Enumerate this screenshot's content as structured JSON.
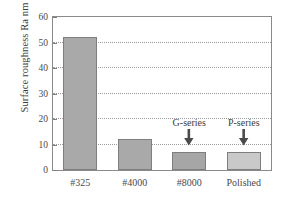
{
  "chart_data": {
    "type": "bar",
    "title": "",
    "xlabel": "",
    "ylabel": "Surface roughness Ra nm",
    "categories": [
      "#325",
      "#4000",
      "#8000",
      "Polished"
    ],
    "values": [
      52,
      12,
      7,
      7
    ],
    "ylim": [
      0,
      60
    ],
    "yticks": [
      0,
      10,
      20,
      30,
      40,
      50,
      60
    ],
    "ytick_labels": [
      "0",
      "10",
      "20",
      "30",
      "40",
      "50",
      "60"
    ],
    "grid": true,
    "grid_axis": "y",
    "legend": "none",
    "bar_colors": [
      "#a9a9a9",
      "#a9a9a9",
      "#a6a6a6",
      "#c9c9c9"
    ],
    "bar_edge_color": "#7e7e7e",
    "annotations": [
      {
        "text": "G-series",
        "points_to_category": "#8000",
        "arrow": "down"
      },
      {
        "text": "P-series",
        "points_to_category": "Polished",
        "arrow": "down"
      }
    ]
  },
  "colors": {
    "background": "#ffffff",
    "frame": "#8a8a8a",
    "gridline": "#9a9a9a",
    "text": "#3d3d3d"
  }
}
